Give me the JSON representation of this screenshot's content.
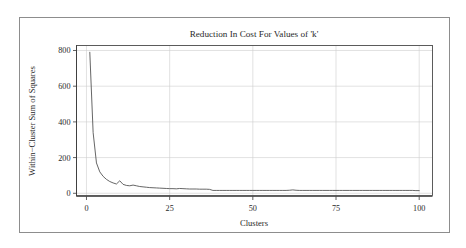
{
  "figure": {
    "title": "Reduction In Cost For Values of 'k'",
    "border_color": "#8d8d8d",
    "background": "#ffffff"
  },
  "axes": {
    "x_label": "Clusters",
    "y_label": "Within−Cluster Sum of Squares",
    "x_ticks": [
      "0",
      "25",
      "50",
      "75",
      "100"
    ],
    "y_ticks": [
      "0",
      "200",
      "400",
      "600",
      "800"
    ]
  },
  "chart_data": {
    "type": "line",
    "title": "Reduction In Cost For Values of 'k'",
    "subtitle": "",
    "xlabel": "Clusters",
    "ylabel": "Within−Cluster Sum of Squares",
    "xlim": [
      -3,
      104
    ],
    "ylim": [
      -18,
      828
    ],
    "xticks": [
      0,
      25,
      50,
      75,
      100
    ],
    "yticks": [
      0,
      200,
      400,
      600,
      800
    ],
    "grid": true,
    "grid_axis": "both",
    "legend": false,
    "legend_position": "none",
    "line_color": "#4a4a4a",
    "series": [
      {
        "name": "Within-Cluster Sum of Squares",
        "x": [
          1,
          2,
          3,
          4,
          5,
          6,
          7,
          8,
          9,
          10,
          11,
          12,
          13,
          14,
          15,
          16,
          17,
          18,
          19,
          20,
          21,
          22,
          23,
          24,
          25,
          26,
          27,
          28,
          29,
          30,
          31,
          32,
          33,
          34,
          35,
          36,
          37,
          38,
          39,
          40,
          41,
          42,
          43,
          44,
          45,
          46,
          47,
          48,
          49,
          50,
          51,
          52,
          53,
          54,
          55,
          56,
          57,
          58,
          59,
          60,
          61,
          62,
          63,
          64,
          65,
          66,
          67,
          68,
          69,
          70,
          71,
          72,
          73,
          74,
          75,
          76,
          77,
          78,
          79,
          80,
          81,
          82,
          83,
          84,
          85,
          86,
          87,
          88,
          89,
          90,
          91,
          92,
          93,
          94,
          95,
          96,
          97,
          98,
          99,
          100
        ],
        "y": [
          790,
          340,
          170,
          120,
          95,
          78,
          66,
          58,
          52,
          70,
          50,
          44,
          42,
          46,
          42,
          38,
          36,
          34,
          32,
          31,
          30,
          29,
          28,
          27,
          26,
          26,
          25,
          27,
          26,
          25,
          24,
          24,
          24,
          23,
          23,
          23,
          22,
          16,
          16,
          16,
          16,
          16,
          16,
          16,
          16,
          16,
          16,
          16,
          16,
          16,
          16,
          16,
          16,
          16,
          16,
          16,
          16,
          16,
          16,
          16,
          17,
          19,
          17,
          16,
          16,
          16,
          16,
          16,
          16,
          16,
          16,
          16,
          16,
          16,
          16,
          16,
          16,
          16,
          16,
          16,
          16,
          16,
          16,
          16,
          16,
          16,
          16,
          16,
          16,
          16,
          16,
          16,
          16,
          16,
          16,
          16,
          16,
          16,
          15,
          15
        ]
      }
    ]
  }
}
